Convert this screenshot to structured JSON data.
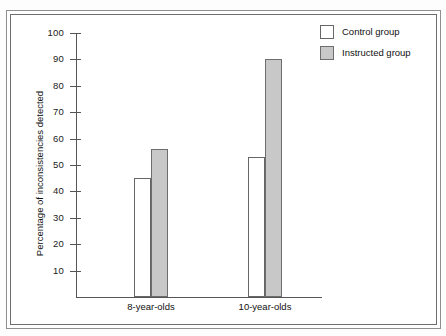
{
  "chart_data": {
    "type": "bar",
    "title": "",
    "xlabel": "",
    "ylabel": "Percentage of inconsistencies detected",
    "categories": [
      "8-year-olds",
      "10-year-olds"
    ],
    "series": [
      {
        "name": "Control group",
        "values": [
          45,
          53
        ],
        "color": "#ffffff"
      },
      {
        "name": "Instructed group",
        "values": [
          56,
          90
        ],
        "color": "#c8c8c8"
      }
    ],
    "ylim": [
      0,
      100
    ],
    "yticks": [
      100,
      90,
      80,
      70,
      60,
      50,
      40,
      30,
      20,
      10
    ],
    "ytick_labels": [
      "100",
      "90",
      "80",
      "70",
      "60",
      "50",
      "40",
      "30",
      "20",
      "10"
    ],
    "grid": false,
    "legend_position": "top-right"
  },
  "legend": {
    "entries": [
      {
        "label": "Control group",
        "swatch": "white-square-swatch"
      },
      {
        "label": "Instructed group",
        "swatch": "gray-square-swatch"
      }
    ]
  },
  "axes": {
    "y_title": "Percentage of inconsistencies detected",
    "x_categories": [
      "8-year-olds",
      "10-year-olds"
    ]
  }
}
